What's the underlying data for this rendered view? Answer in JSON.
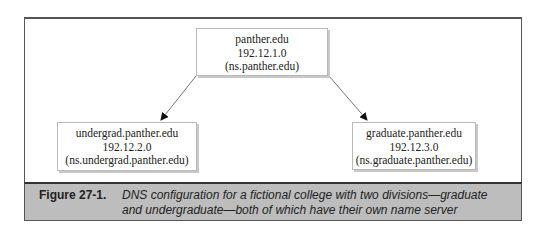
{
  "diagram": {
    "nodes": [
      {
        "id": "root",
        "lines": [
          "panther.edu",
          "192.12.1.0",
          "(ns.panther.edu)"
        ]
      },
      {
        "id": "undergrad",
        "lines": [
          "undergrad.panther.edu",
          "192.12.2.0",
          "(ns.undergrad.panther.edu)"
        ]
      },
      {
        "id": "graduate",
        "lines": [
          "graduate.panther.edu",
          "192.12.3.0",
          "(ns.graduate.panther.edu)"
        ]
      }
    ],
    "edges": [
      {
        "from": "root",
        "to": "undergrad"
      },
      {
        "from": "root",
        "to": "graduate"
      }
    ]
  },
  "caption": {
    "label": "Figure 27-1.",
    "lines": [
      "DNS configuration for a fictional college with two divisions—graduate",
      "and undergraduate—both of which have their own name server"
    ]
  }
}
